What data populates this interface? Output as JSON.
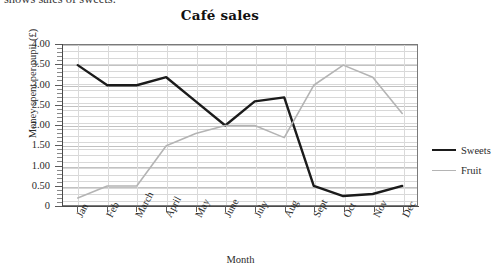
{
  "caption": "shows sales of sweets.",
  "chart_data": {
    "type": "line",
    "title": "Café sales",
    "xlabel": "Month",
    "ylabel": "Money spent per pupil (£)",
    "categories": [
      "Jan",
      "Feb",
      "March",
      "April",
      "May",
      "June",
      "July",
      "Aug",
      "Sept",
      "Oct",
      "Nov",
      "Dec"
    ],
    "ylim": [
      0,
      4.0
    ],
    "ytick_labels": [
      "0",
      "0.50",
      "1.00",
      "1.50",
      "2.00",
      "2.50",
      "3.00",
      "3.50",
      "4.00"
    ],
    "ytick_values": [
      0,
      0.5,
      1.0,
      1.5,
      2.0,
      2.5,
      3.0,
      3.5,
      4.0
    ],
    "ytick_step": 0.5,
    "yminor_step": 0.1,
    "grid": true,
    "legend_position": "right",
    "series": [
      {
        "name": "Sweets",
        "color": "#1b1b1b",
        "width": 2.4,
        "values": [
          3.5,
          3.0,
          3.0,
          3.2,
          2.6,
          2.0,
          2.6,
          2.7,
          0.5,
          0.25,
          0.3,
          0.5
        ]
      },
      {
        "name": "Fruit",
        "color": "#b4b4b4",
        "width": 1.6,
        "values": [
          0.2,
          0.5,
          0.5,
          1.5,
          1.8,
          2.0,
          2.0,
          1.7,
          3.0,
          3.5,
          3.2,
          2.3
        ]
      }
    ]
  }
}
